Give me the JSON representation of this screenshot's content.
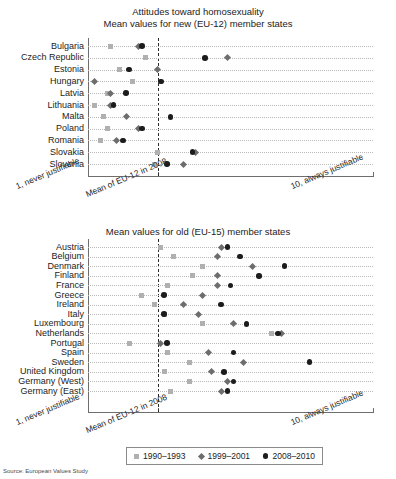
{
  "figure": {
    "title": "Attitudes toward homosexuality",
    "source": "Source: European Values Study"
  },
  "legend": {
    "entries": [
      {
        "label": "1990–1993",
        "marker": "square",
        "color": "#b0b0b0"
      },
      {
        "label": "1999–2001",
        "marker": "diamond",
        "color": "#6d6d6d"
      },
      {
        "label": "2008–2010",
        "marker": "circle",
        "color": "#1c1c1c"
      }
    ]
  },
  "axis": {
    "left_label": "1, never justifiable",
    "right_label": "10, always justifiable",
    "reference_label": "Mean of EU-12 in 2008",
    "min": 1,
    "max": 10,
    "reference_value": 3.2
  },
  "chart_data": [
    {
      "type": "scatter",
      "id": "new-member-states",
      "title": "Attitudes toward homosexuality",
      "subtitle": "Mean values for new (EU-12) member states",
      "xlabel": "",
      "ylabel": "",
      "xlim": [
        1,
        10
      ],
      "grid": true,
      "legend_position": "bottom",
      "reference_line": {
        "value": 3.2,
        "label": "Mean of EU-12 in 2008",
        "style": "dashed"
      },
      "categories": [
        "Bulgaria",
        "Czech Republic",
        "Estonia",
        "Hungary",
        "Latvia",
        "Lithuania",
        "Malta",
        "Poland",
        "Romania",
        "Slovakia",
        "Slovenia"
      ],
      "series": [
        {
          "name": "1990–1993",
          "marker": "square",
          "values": [
            1.7,
            2.8,
            2.0,
            2.4,
            1.6,
            1.2,
            1.5,
            1.6,
            1.4,
            3.2,
            3.1
          ]
        },
        {
          "name": "1999–2001",
          "marker": "diamond",
          "values": [
            2.6,
            5.4,
            3.2,
            1.2,
            1.7,
            1.7,
            2.2,
            2.6,
            1.9,
            4.4,
            4.0
          ]
        },
        {
          "name": "2008–2010",
          "marker": "circle",
          "values": [
            2.7,
            4.7,
            2.3,
            3.3,
            2.2,
            1.8,
            3.6,
            2.7,
            2.1,
            4.3,
            3.5
          ]
        }
      ]
    },
    {
      "type": "scatter",
      "id": "old-member-states",
      "title": "",
      "subtitle": "Mean values for old (EU-15) member states",
      "xlabel": "",
      "ylabel": "",
      "xlim": [
        1,
        10
      ],
      "grid": true,
      "legend_position": "bottom",
      "reference_line": {
        "value": 3.2,
        "label": "Mean of EU-12 in 2008",
        "style": "dashed"
      },
      "categories": [
        "Austria",
        "Belgium",
        "Denmark",
        "Finland",
        "France",
        "Greece",
        "Ireland",
        "Italy",
        "Luxembourg",
        "Netherlands",
        "Portugal",
        "Spain",
        "Sweden",
        "United Kingdom",
        "Germany (West)",
        "Germany (East)"
      ],
      "series": [
        {
          "name": "1990–1993",
          "marker": "square",
          "values": [
            3.3,
            3.7,
            4.6,
            4.3,
            3.5,
            2.7,
            3.1,
            3.4,
            4.6,
            6.8,
            2.3,
            3.5,
            4.2,
            3.4,
            4.2,
            3.6
          ]
        },
        {
          "name": "1999–2001",
          "marker": "diamond",
          "values": [
            5.2,
            5.1,
            6.2,
            5.1,
            5.1,
            4.6,
            4.0,
            4.5,
            5.6,
            7.1,
            3.3,
            4.8,
            5.9,
            4.9,
            5.4,
            5.2
          ]
        },
        {
          "name": "2008–2010",
          "marker": "circle",
          "values": [
            5.4,
            5.8,
            7.2,
            6.4,
            5.5,
            3.4,
            5.2,
            3.4,
            6.0,
            7.0,
            3.5,
            5.6,
            8.0,
            5.3,
            5.6,
            5.4
          ]
        }
      ]
    }
  ]
}
